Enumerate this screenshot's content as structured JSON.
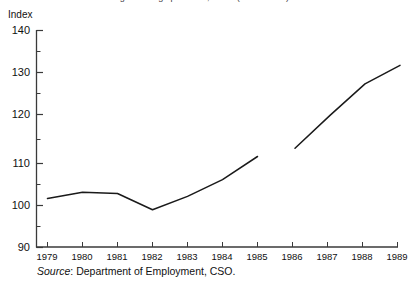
{
  "figure": {
    "clipped_title": "Average earnings per head, index (1979 = 100)",
    "unit_label": "Index",
    "source_prefix": "Source",
    "source_separator": ":",
    "source_text": "Department of Employment, CSO.",
    "line_color": "#1a1a1a",
    "axis_color": "#3a3a3a"
  },
  "chart_data": {
    "type": "line",
    "title": "Average earnings per head, index (1979 = 100)",
    "xlabel": "",
    "ylabel": "Index",
    "ylim": [
      90,
      140
    ],
    "xlim": [
      1979,
      1989
    ],
    "grid": false,
    "legend": "none",
    "y_ticks": [
      140,
      130,
      120,
      110,
      100,
      90
    ],
    "y_minor_ticks": [
      135,
      125,
      115,
      105,
      95
    ],
    "x": [
      1979,
      1980,
      1981,
      1982,
      1983,
      1984,
      1985,
      1986,
      1987,
      1988,
      1989
    ],
    "categories": [
      "1979",
      "1980",
      "1981",
      "1982",
      "1983",
      "1984",
      "1985",
      "1986",
      "1987",
      "1988",
      "1989"
    ],
    "values": [
      100.0,
      101.5,
      101.2,
      97.3,
      100.5,
      104.5,
      110.0,
      111.7,
      119.5,
      127.0,
      131.4
    ],
    "series": [
      {
        "name": "Index",
        "values": [
          100.0,
          101.5,
          101.2,
          97.3,
          100.5,
          104.5,
          110.0,
          111.7,
          119.5,
          127.0,
          131.4
        ]
      }
    ],
    "annotations": [
      {
        "note": "small break in plotted line at 1985",
        "x": 1985,
        "y": 110.0
      }
    ]
  }
}
